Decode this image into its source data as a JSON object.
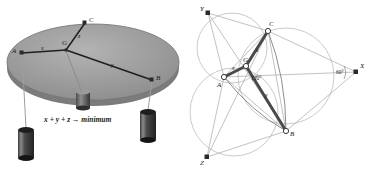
{
  "figure": {
    "name": "steiner-point-mechanical-analogue",
    "panels": [
      {
        "id": "left",
        "name": "weights-on-table-apparatus"
      },
      {
        "id": "right",
        "name": "steiner-point-construction"
      }
    ]
  },
  "left_panel": {
    "caption": "x + y + z → minimum",
    "points": [
      {
        "label": "A",
        "x": 22,
        "y": 53
      },
      {
        "label": "B",
        "x": 152,
        "y": 80
      },
      {
        "label": "C",
        "x": 85,
        "y": 23
      },
      {
        "label": "G",
        "x": 66,
        "y": 50
      }
    ],
    "segments": [
      {
        "label": "x",
        "from": "A",
        "to": "G"
      },
      {
        "label": "y",
        "from": "G",
        "to": "B"
      },
      {
        "label": "z",
        "from": "G",
        "to": "C"
      }
    ],
    "segment_labels": [
      {
        "text": "x",
        "x": 43,
        "y": 50
      },
      {
        "text": "y",
        "x": 113,
        "y": 66
      },
      {
        "text": "z",
        "x": 80,
        "y": 37
      }
    ],
    "weights": [
      {
        "name": "weight-left",
        "pulley_at": "A",
        "cx": 26,
        "top": 128
      },
      {
        "name": "weight-right",
        "pulley_at": "B",
        "cx": 148,
        "top": 110
      },
      {
        "name": "weight-center",
        "pulley_at": "G",
        "cx": 82,
        "top": 95
      }
    ],
    "table_color": "#9a9a9a",
    "table_edge_color": "#6d6d6d"
  },
  "right_panel": {
    "points": [
      {
        "label": "Y",
        "x": 22,
        "y": 13
      },
      {
        "label": "C",
        "x": 82,
        "y": 31
      },
      {
        "label": "X",
        "x": 170,
        "y": 72
      },
      {
        "label": "A",
        "x": 38,
        "y": 77
      },
      {
        "label": "G",
        "x": 60,
        "y": 66
      },
      {
        "label": "B",
        "x": 100,
        "y": 131
      },
      {
        "label": "Z",
        "x": 21,
        "y": 157
      }
    ],
    "segment_labels": [
      {
        "text": "x",
        "x": 48,
        "y": 70
      },
      {
        "text": "y",
        "x": 81,
        "y": 96
      },
      {
        "text": "z",
        "x": 72,
        "y": 51
      }
    ],
    "angles": [
      {
        "text": "120°",
        "x": 70,
        "y": 77
      },
      {
        "text": "60°",
        "x": 155,
        "y": 72
      }
    ],
    "circle_color": "#b7b7b7",
    "thin_line_color": "#a8a8a8",
    "medium_line_color": "#6f6f6f",
    "bold_line_color": "#4a4a4a"
  }
}
